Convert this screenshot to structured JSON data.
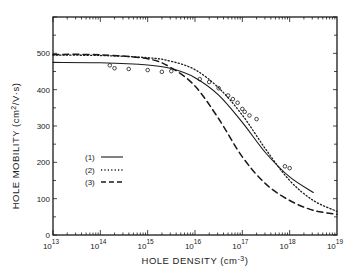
{
  "chart_data": {
    "type": "line",
    "title": "",
    "xlabel": "HOLE DENSITY (cm-3)",
    "ylabel": "HOLE MOBILITY (cm2/V·s)",
    "xscale": "log",
    "xlim": [
      10000000000000.0,
      1e+19
    ],
    "ylim": [
      0,
      600
    ],
    "x_tick_labels": [
      "10^13",
      "10^14",
      "10^15",
      "10^16",
      "10^17",
      "10^18",
      "10^19"
    ],
    "y_tick_labels": [
      "0",
      "100",
      "200",
      "300",
      "400",
      "500"
    ],
    "grid": false,
    "legend_position": "inside-left-middle",
    "series": [
      {
        "name": "(1)",
        "style": "solid",
        "log10_x": [
          13,
          14,
          15,
          15.5,
          16,
          16.5,
          17,
          17.5,
          18,
          18.5
        ],
        "values": [
          475,
          474,
          468,
          458,
          433,
          385,
          310,
          225,
          160,
          117
        ]
      },
      {
        "name": "(2)",
        "style": "dotted",
        "log10_x": [
          13,
          14,
          15,
          15.5,
          16,
          16.5,
          17,
          17.5,
          18,
          18.5,
          19
        ],
        "values": [
          495,
          494,
          488,
          478,
          455,
          405,
          330,
          235,
          150,
          95,
          65
        ]
      },
      {
        "name": "(3)",
        "style": "dashed",
        "log10_x": [
          13,
          14,
          15,
          15.5,
          16,
          16.5,
          17,
          17.5,
          18,
          18.5,
          19
        ],
        "values": [
          497,
          496,
          485,
          460,
          410,
          320,
          215,
          140,
          95,
          68,
          57
        ]
      }
    ],
    "markers": {
      "name": "experimental points",
      "log10_x": [
        14.2,
        14.3,
        14.6,
        15.0,
        15.3,
        15.5,
        16.1,
        16.3,
        16.5,
        16.7,
        16.8,
        16.9,
        17.0,
        17.05,
        17.15,
        17.3,
        17.9,
        18.0
      ],
      "values": [
        478,
        470,
        468,
        465,
        460,
        462,
        440,
        432,
        415,
        395,
        385,
        375,
        358,
        350,
        340,
        330,
        200,
        195
      ]
    }
  },
  "labels": {
    "y_title_main": "HOLE MOBILITY (cm",
    "y_title_sup": "2",
    "y_title_end": "/V·s)",
    "x_title_main": "HOLE DENSITY (cm",
    "x_title_sup": "-3",
    "x_title_end": ")",
    "x_ticks": [
      {
        "base": "10",
        "exp": "13"
      },
      {
        "base": "10",
        "exp": "14"
      },
      {
        "base": "10",
        "exp": "15"
      },
      {
        "base": "10",
        "exp": "16"
      },
      {
        "base": "10",
        "exp": "17"
      },
      {
        "base": "10",
        "exp": "18"
      },
      {
        "base": "10",
        "exp": "19"
      }
    ],
    "y_ticks": [
      "0",
      "100",
      "200",
      "300",
      "400",
      "500"
    ],
    "legend": [
      "(1)",
      "(2)",
      "(3)"
    ]
  }
}
